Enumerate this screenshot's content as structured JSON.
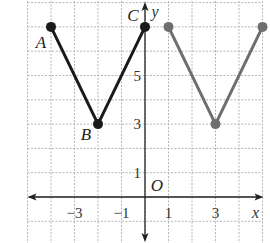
{
  "figure": {
    "grid": {
      "x_range": [
        -5,
        5
      ],
      "y_range": [
        -2,
        8
      ],
      "step": 1
    },
    "axes": {
      "x_label": "x",
      "y_label": "y",
      "origin_label": "O",
      "x_ticks": [
        {
          "value": -3,
          "label": "−3"
        },
        {
          "value": -1,
          "label": "−1"
        },
        {
          "value": 1,
          "label": "1"
        },
        {
          "value": 3,
          "label": "3"
        }
      ],
      "y_ticks": [
        {
          "value": 1,
          "label": "1"
        },
        {
          "value": 3,
          "label": "3"
        },
        {
          "value": 5,
          "label": "5"
        }
      ]
    },
    "graphs": [
      {
        "name": "original",
        "color": "#1a1a1a",
        "points": [
          {
            "label": "A",
            "x": -4,
            "y": 7
          },
          {
            "label": "B",
            "x": -2,
            "y": 3
          },
          {
            "label": "C",
            "x": 0,
            "y": 7
          }
        ]
      },
      {
        "name": "translated",
        "color": "#6e6e6e",
        "points": [
          {
            "label": "",
            "x": 1,
            "y": 7
          },
          {
            "label": "",
            "x": 3,
            "y": 3
          },
          {
            "label": "",
            "x": 5,
            "y": 7
          }
        ]
      }
    ]
  }
}
